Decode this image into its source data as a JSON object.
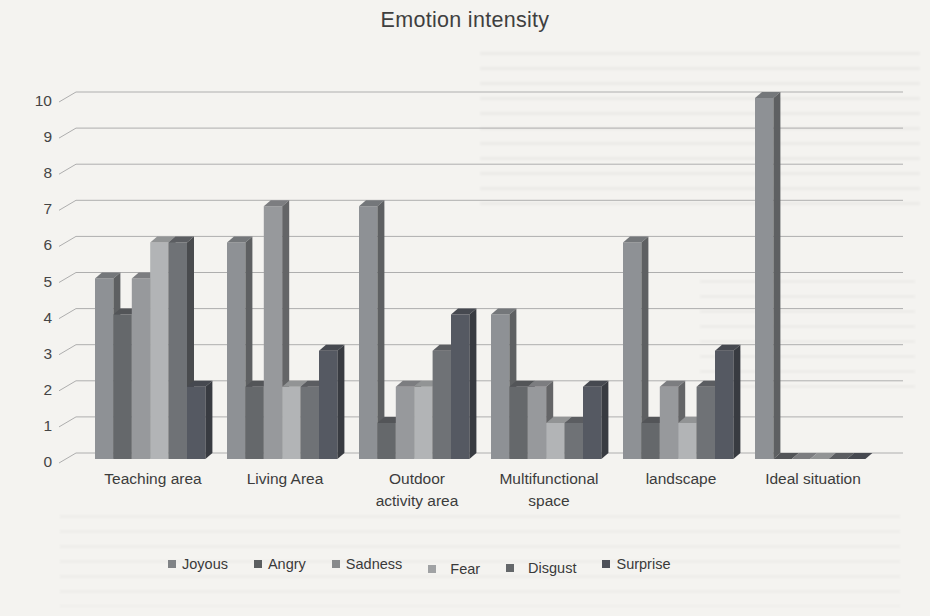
{
  "page": {
    "background_color": "#f4f3f0",
    "text_color": "#3f3f3f"
  },
  "chart_data": {
    "type": "bar",
    "projection": "3d-clustered-column",
    "title": "Emotion intensity",
    "categories": [
      "Teaching area",
      "Living Area",
      "Outdoor activity area",
      "Multifunctional space",
      "landscape",
      "Ideal situation"
    ],
    "category_label_lines": [
      [
        "Teaching area"
      ],
      [
        "Living Area"
      ],
      [
        "Outdoor",
        "activity area"
      ],
      [
        "Multifunctional",
        "space"
      ],
      [
        "landscape"
      ],
      [
        "Ideal situation"
      ]
    ],
    "series": [
      {
        "name": "Joyous",
        "color": "#8e9195",
        "values": [
          5,
          6,
          7,
          4,
          6,
          10
        ]
      },
      {
        "name": "Angry",
        "color": "#65686b",
        "values": [
          4,
          2,
          1,
          2,
          1,
          0
        ]
      },
      {
        "name": "Sadness",
        "color": "#97999c",
        "values": [
          5,
          7,
          2,
          2,
          2,
          0
        ]
      },
      {
        "name": "Fear",
        "color": "#b2b4b6",
        "values": [
          6,
          2,
          2,
          1,
          1,
          0
        ]
      },
      {
        "name": "Disgust",
        "color": "#6f7276",
        "values": [
          6,
          2,
          3,
          1,
          2,
          0
        ]
      },
      {
        "name": "Surprise",
        "color": "#555962",
        "values": [
          2,
          3,
          4,
          2,
          3,
          0
        ]
      }
    ],
    "ylim": [
      0,
      10
    ],
    "ytick_step": 1,
    "yticks": [
      0,
      1,
      2,
      3,
      4,
      5,
      6,
      7,
      8,
      9,
      10
    ],
    "grid": true,
    "gridline_color": "#aeaeae",
    "axis_text_color": "#454545",
    "legend_position": "bottom",
    "legend_entries": [
      "Joyous",
      "Angry",
      "Sadness",
      "Fear",
      "Disgust",
      "Surprise"
    ]
  }
}
